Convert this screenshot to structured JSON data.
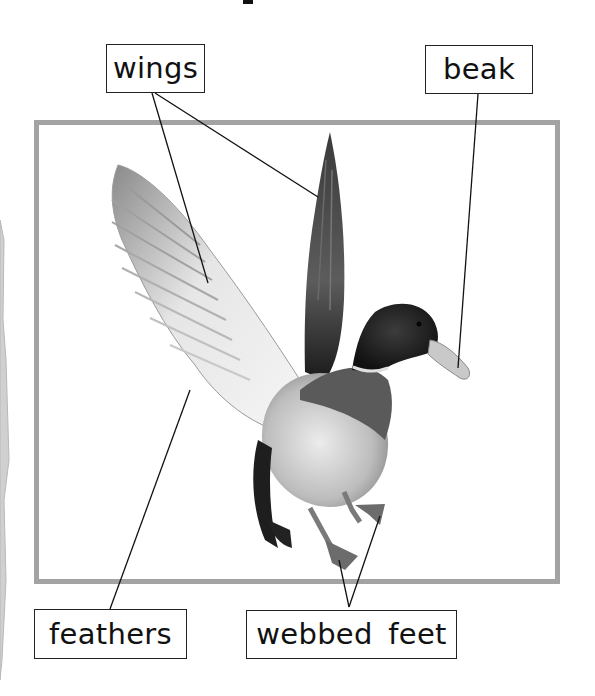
{
  "diagram": {
    "style": "grayscale labelled photograph",
    "frame_color": "#a3a3a3",
    "leader_color": "#111111",
    "labels": [
      {
        "id": "wings",
        "text": "wings"
      },
      {
        "id": "beak",
        "text": "beak"
      },
      {
        "id": "feathers",
        "text": "feathers"
      },
      {
        "id": "webbed_feet",
        "text": "webbed feet"
      }
    ]
  },
  "labels": {
    "wings": "wings",
    "beak": "beak",
    "feathers": "feathers",
    "webbed_feet": "webbed feet"
  }
}
